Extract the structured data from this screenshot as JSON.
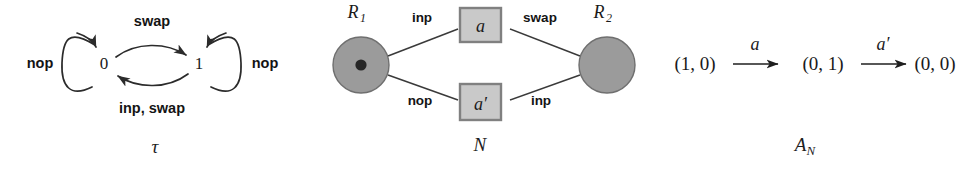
{
  "figure": {
    "background": "#ffffff",
    "panels": [
      "transition-system",
      "petri-net",
      "automaton"
    ]
  },
  "colors": {
    "ink": "#1a1a1a",
    "stroke": "#2b2b2b",
    "place_fill": "#9b9b9b",
    "place_stroke": "#6f6f6f",
    "token_fill": "#262626",
    "transition_fill": "#c9c9c9",
    "transition_stroke": "#808080"
  },
  "transition_system": {
    "caption": "τ",
    "states": [
      {
        "id": "s0",
        "label": "0"
      },
      {
        "id": "s1",
        "label": "1"
      }
    ],
    "self_loops": [
      {
        "state": "s0",
        "label": "nop",
        "side": "left"
      },
      {
        "state": "s1",
        "label": "nop",
        "side": "right"
      }
    ],
    "edges": [
      {
        "from": "0",
        "to": "1",
        "label": "swap",
        "position": "top"
      },
      {
        "from": "1",
        "to": "0",
        "label": "inp, swap",
        "position": "bottom"
      }
    ]
  },
  "petri_net": {
    "caption": "N",
    "places": [
      {
        "id": "R1",
        "label": "R",
        "subscript": "1",
        "tokens": 1
      },
      {
        "id": "R2",
        "label": "R",
        "subscript": "2",
        "tokens": 0
      }
    ],
    "transitions": [
      {
        "id": "t-a",
        "label": "a",
        "position": "top"
      },
      {
        "id": "t-a-prime",
        "label": "a′",
        "position": "bottom"
      }
    ],
    "arcs": [
      {
        "from": "R1",
        "to": "t-a",
        "label": "inp"
      },
      {
        "from": "t-a",
        "to": "R2",
        "label": "swap"
      },
      {
        "from": "R1",
        "to": "t-a-prime",
        "label": "nop"
      },
      {
        "from": "t-a-prime",
        "to": "R2",
        "label": "inp"
      }
    ]
  },
  "automaton": {
    "caption": "A",
    "caption_subscript": "N",
    "run": {
      "states": [
        "(1, 0)",
        "(0, 1)",
        "(0, 0)"
      ],
      "transitions": [
        "a",
        "a′"
      ]
    }
  }
}
